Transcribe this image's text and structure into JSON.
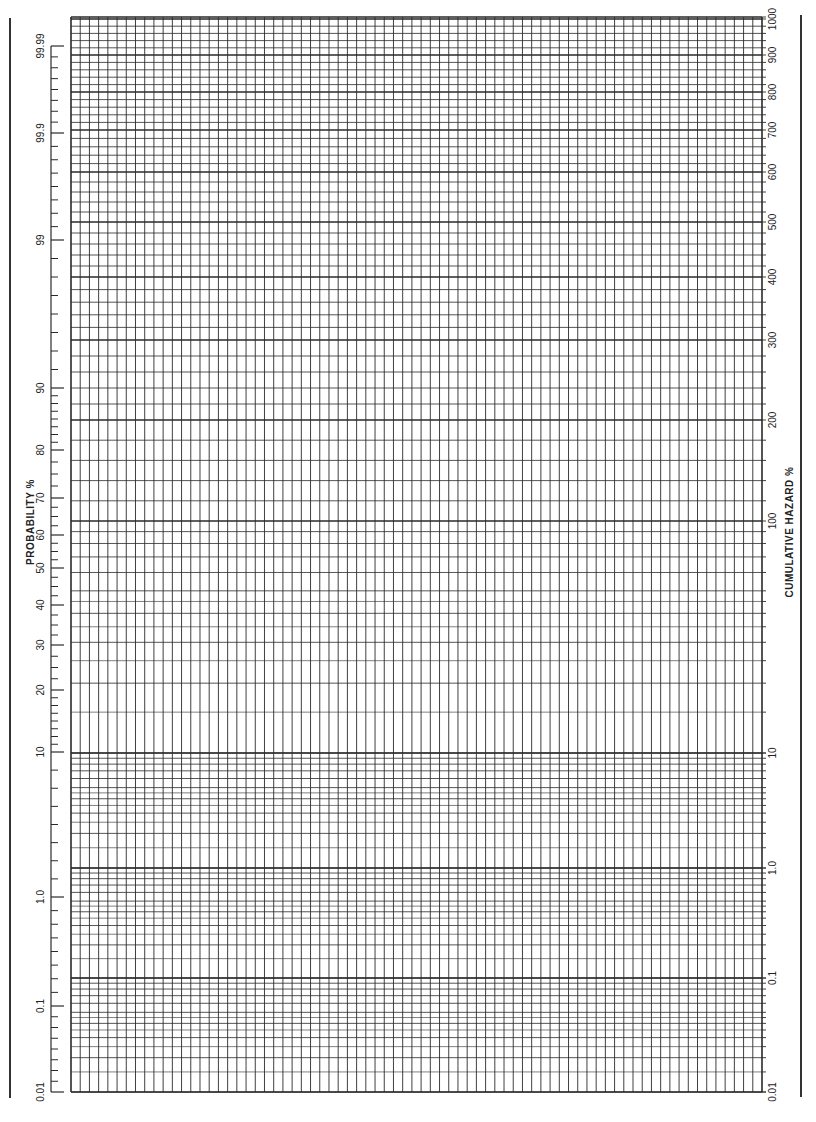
{
  "chart_data": {
    "type": "table",
    "left_axis": {
      "label": "PROBABILITY %",
      "ticks": [
        "99.99",
        "99.9",
        "99",
        "90",
        "80",
        "70",
        "60",
        "50",
        "40",
        "30",
        "20",
        "10",
        "1.0",
        "0.1",
        "0.01"
      ],
      "tick_y": [
        46,
        133,
        240,
        388,
        450,
        498,
        535,
        568,
        605,
        645,
        690,
        752,
        897,
        1006,
        1092
      ]
    },
    "right_axis": {
      "label": "CUMULATIVE HAZARD %",
      "ticks": [
        "1000",
        "900",
        "800",
        "700",
        "600",
        "500",
        "400",
        "300",
        "200",
        "100",
        "10",
        "1.0",
        "0.1",
        "0.01"
      ],
      "tick_y": [
        19,
        55,
        92,
        130,
        172,
        222,
        277,
        340,
        420,
        521,
        753,
        868,
        978,
        1092
      ]
    },
    "x_axis": {
      "label": "",
      "ticks": [],
      "divisions": 75
    },
    "grid": true,
    "plot_area": {
      "left": 71,
      "top": 17,
      "right": 762,
      "bottom": 1092
    },
    "data": []
  },
  "labels": {
    "left_title": "PROBABILITY %",
    "right_title": "CUMULATIVE HAZARD %"
  },
  "colors": {
    "grid": "#2a2a2a",
    "border": "#333333",
    "paper": "#ffffff"
  }
}
